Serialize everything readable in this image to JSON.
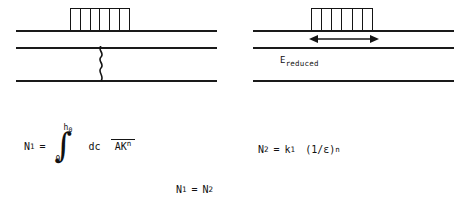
{
  "figure": {
    "ink_color": "#151515",
    "background": "#ffffff"
  },
  "panels": [
    {
      "id": "left",
      "name": "cracked-specimen-panel",
      "load_block": {
        "label": "hatched-load-block",
        "hatch_count": 7
      },
      "lines": [
        "top-surface-line",
        "middle-line",
        "bottom-line"
      ],
      "crack": {
        "label": "crack-wavy-line"
      }
    },
    {
      "id": "right",
      "name": "reduced-modulus-panel",
      "load_block": {
        "label": "hatched-load-block",
        "hatch_count": 7
      },
      "lines": [
        "top-surface-line",
        "middle-line",
        "bottom-line"
      ],
      "arrow": {
        "label": "double-headed-arrow"
      },
      "annotation": {
        "base": "E",
        "subscript": "reduced",
        "full": "E_reduced"
      }
    }
  ],
  "equations": {
    "left": {
      "lhs_base": "N",
      "lhs_sub": "1",
      "equals": "=",
      "integral_symbol": "∫",
      "upper_limit_base": "h",
      "upper_limit_sub": "0",
      "lower_limit": "0",
      "numerator": "dc",
      "denominator_base": "AK",
      "denominator_exp": "n"
    },
    "right": {
      "lhs_base": "N",
      "lhs_sub": "2",
      "equals": "=",
      "coefficient_base": "k",
      "coefficient_sub": "1",
      "term": "(1/ε)",
      "exponent": "n"
    },
    "center": {
      "lhs_base": "N",
      "lhs_sub": "1",
      "equals": "=",
      "rhs_base": "N",
      "rhs_sub": "2"
    }
  }
}
